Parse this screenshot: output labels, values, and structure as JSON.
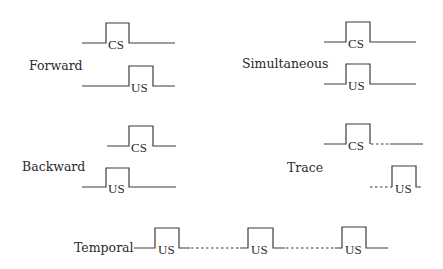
{
  "diagram": {
    "procedures": [
      {
        "id": "forward",
        "label": "Forward",
        "traces": [
          {
            "signal": "CS",
            "label": "CS",
            "onset": 1,
            "offset": 2,
            "gap_dotted": false
          },
          {
            "signal": "US",
            "label": "US",
            "onset": 2,
            "offset": 3,
            "gap_dotted": false
          }
        ]
      },
      {
        "id": "simultaneous",
        "label": "Simultaneous",
        "traces": [
          {
            "signal": "CS",
            "label": "CS",
            "onset": 1,
            "offset": 2,
            "gap_dotted": false
          },
          {
            "signal": "US",
            "label": "US",
            "onset": 1,
            "offset": 2,
            "gap_dotted": false
          }
        ]
      },
      {
        "id": "backward",
        "label": "Backward",
        "traces": [
          {
            "signal": "CS",
            "label": "CS",
            "onset": 2,
            "offset": 3,
            "gap_dotted": false
          },
          {
            "signal": "US",
            "label": "US",
            "onset": 1,
            "offset": 2,
            "gap_dotted": false
          }
        ]
      },
      {
        "id": "trace",
        "label": "Trace",
        "traces": [
          {
            "signal": "CS",
            "label": "CS",
            "onset": 1,
            "offset": 2,
            "gap_dotted": true
          },
          {
            "signal": "US",
            "label": "US",
            "onset": 3,
            "offset": 4,
            "gap_dotted": true
          }
        ]
      },
      {
        "id": "temporal",
        "label": "Temporal",
        "traces": [
          {
            "signal": "US",
            "label": "US",
            "pulses": 3,
            "gap_dotted": true
          }
        ]
      }
    ]
  }
}
